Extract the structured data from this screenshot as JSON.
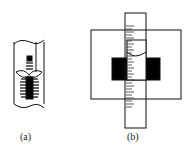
{
  "figure": {
    "panels": [
      {
        "id": "a",
        "label": "(a)"
      },
      {
        "id": "b",
        "label": "(b)"
      }
    ],
    "colors": {
      "stroke": "#111111",
      "fill": "#000000",
      "background": "#ffffff"
    }
  }
}
